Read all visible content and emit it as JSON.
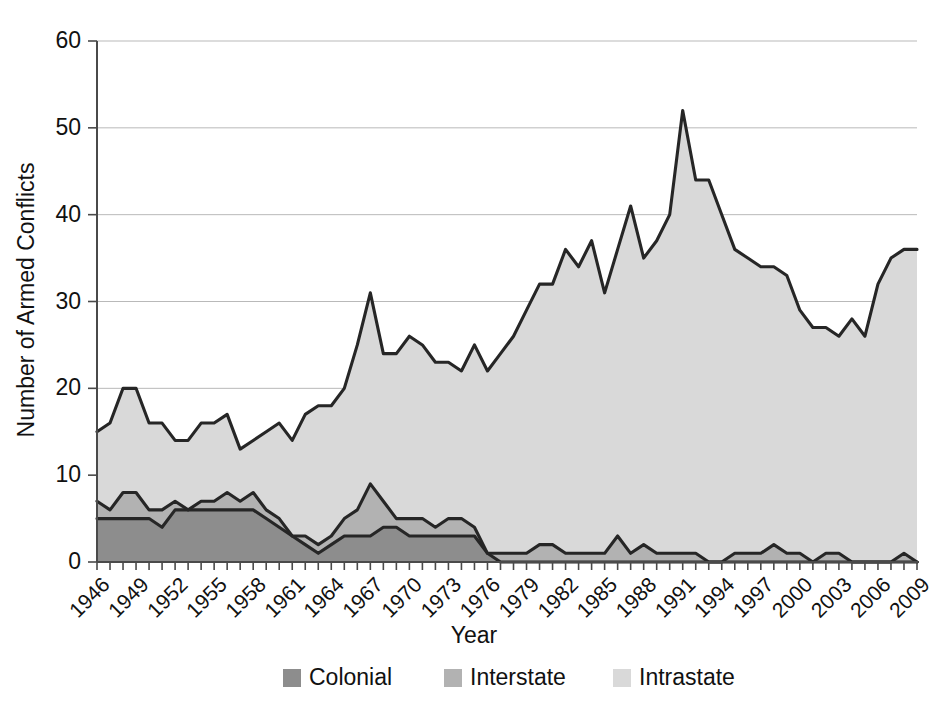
{
  "chart_data": {
    "type": "area",
    "stacked": true,
    "title": "",
    "xlabel": "Year",
    "ylabel": "Number of Armed Conflicts",
    "xlim": [
      1946,
      2009
    ],
    "ylim": [
      0,
      60
    ],
    "yticks": [
      0,
      10,
      20,
      30,
      40,
      50,
      60
    ],
    "xticks": [
      1946,
      1949,
      1952,
      1955,
      1958,
      1961,
      1964,
      1967,
      1970,
      1973,
      1976,
      1979,
      1982,
      1985,
      1988,
      1991,
      1994,
      1997,
      2000,
      2003,
      2006,
      2009
    ],
    "grid": "horizontal",
    "legend_position": "bottom",
    "x": [
      1946,
      1947,
      1948,
      1949,
      1950,
      1951,
      1952,
      1953,
      1954,
      1955,
      1956,
      1957,
      1958,
      1959,
      1960,
      1961,
      1962,
      1963,
      1964,
      1965,
      1966,
      1967,
      1968,
      1969,
      1970,
      1971,
      1972,
      1973,
      1974,
      1975,
      1976,
      1977,
      1978,
      1979,
      1980,
      1981,
      1982,
      1983,
      1984,
      1985,
      1986,
      1987,
      1988,
      1989,
      1990,
      1991,
      1992,
      1993,
      1994,
      1995,
      1996,
      1997,
      1998,
      1999,
      2000,
      2001,
      2002,
      2003,
      2004,
      2005,
      2006,
      2007,
      2008,
      2009
    ],
    "series": [
      {
        "name": "Colonial",
        "color": "#8d8d8d",
        "values": [
          5,
          5,
          5,
          5,
          5,
          4,
          6,
          6,
          6,
          6,
          6,
          6,
          6,
          5,
          4,
          3,
          2,
          1,
          2,
          3,
          3,
          3,
          4,
          4,
          3,
          3,
          3,
          3,
          3,
          3,
          1,
          0,
          0,
          0,
          0,
          0,
          0,
          0,
          0,
          0,
          0,
          0,
          0,
          0,
          0,
          0,
          0,
          0,
          0,
          0,
          0,
          0,
          0,
          0,
          0,
          0,
          0,
          0,
          0,
          0,
          0,
          0,
          0,
          0
        ]
      },
      {
        "name": "Interstate",
        "color": "#b2b2b2",
        "values": [
          2,
          1,
          3,
          3,
          1,
          2,
          1,
          0,
          1,
          1,
          2,
          1,
          2,
          1,
          1,
          0,
          1,
          1,
          1,
          2,
          3,
          6,
          3,
          1,
          2,
          2,
          1,
          2,
          2,
          1,
          0,
          1,
          1,
          1,
          2,
          2,
          1,
          1,
          1,
          1,
          3,
          1,
          2,
          1,
          1,
          1,
          1,
          0,
          0,
          1,
          1,
          1,
          2,
          1,
          1,
          0,
          1,
          1,
          0,
          0,
          0,
          0,
          1,
          0
        ]
      },
      {
        "name": "Intrastate",
        "color": "#d9d9d9",
        "values": [
          8,
          10,
          12,
          12,
          10,
          10,
          7,
          8,
          9,
          9,
          9,
          6,
          6,
          9,
          11,
          11,
          14,
          16,
          15,
          15,
          19,
          22,
          17,
          19,
          21,
          20,
          19,
          18,
          17,
          21,
          21,
          23,
          25,
          28,
          30,
          30,
          35,
          33,
          36,
          30,
          33,
          40,
          33,
          36,
          39,
          51,
          43,
          44,
          40,
          35,
          34,
          33,
          32,
          32,
          28,
          27,
          26,
          25,
          28,
          26,
          32,
          35,
          35,
          36
        ]
      }
    ],
    "totals": [
      15,
      16,
      20,
      20,
      16,
      16,
      14,
      14,
      16,
      16,
      17,
      13,
      14,
      15,
      16,
      14,
      17,
      18,
      18,
      20,
      25,
      31,
      24,
      24,
      26,
      25,
      23,
      23,
      22,
      25,
      22,
      24,
      26,
      29,
      32,
      32,
      36,
      34,
      37,
      31,
      36,
      41,
      35,
      37,
      40,
      52,
      44,
      44,
      40,
      36,
      35,
      34,
      34,
      33,
      29,
      27,
      27,
      26,
      28,
      26,
      32,
      35,
      36,
      36
    ]
  },
  "axes": {
    "y_title": "Number of Armed Conflicts",
    "x_title": "Year",
    "y_labels": [
      "0",
      "10",
      "20",
      "30",
      "40",
      "50",
      "60"
    ],
    "x_labels": [
      "1946",
      "1949",
      "1952",
      "1955",
      "1958",
      "1961",
      "1964",
      "1967",
      "1970",
      "1973",
      "1976",
      "1979",
      "1982",
      "1985",
      "1988",
      "1991",
      "1994",
      "1997",
      "2000",
      "2003",
      "2006",
      "2009"
    ]
  },
  "legend": {
    "items": [
      {
        "label": "Colonial",
        "color": "#8d8d8d"
      },
      {
        "label": "Interstate",
        "color": "#b2b2b2"
      },
      {
        "label": "Intrastate",
        "color": "#d9d9d9"
      }
    ]
  }
}
